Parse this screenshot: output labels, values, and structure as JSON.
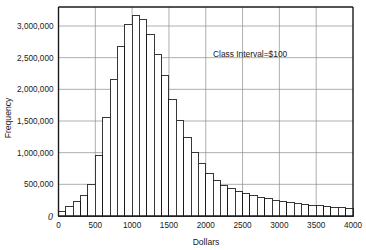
{
  "chart_data": {
    "type": "bar",
    "title": "",
    "xlabel": "Dollars",
    "ylabel": "Frequency",
    "annotation": "Class Interval=$100",
    "xlim": [
      0,
      4000
    ],
    "ylim": [
      0,
      3300000
    ],
    "grid": true,
    "legend": "none",
    "xticks": [
      0,
      500,
      1000,
      1500,
      2000,
      2500,
      3000,
      3500,
      4000
    ],
    "xtick_labels": [
      "0",
      "500",
      "1000",
      "1500",
      "2000",
      "2500",
      "3000",
      "3500",
      "4000"
    ],
    "yticks": [
      0,
      500000,
      1000000,
      1500000,
      2000000,
      2500000,
      3000000
    ],
    "ytick_labels": [
      "0",
      "500,000",
      "1,000,000",
      "1,500,000",
      "2,000,000",
      "2,500,000",
      "3,000,000"
    ],
    "bars": [
      {
        "x0": 0,
        "x1": 100,
        "value": 70000
      },
      {
        "x0": 100,
        "x1": 200,
        "value": 150000
      },
      {
        "x0": 200,
        "x1": 300,
        "value": 225000
      },
      {
        "x0": 300,
        "x1": 400,
        "value": 330000
      },
      {
        "x0": 400,
        "x1": 500,
        "value": 505000
      },
      {
        "x0": 500,
        "x1": 600,
        "value": 955000
      },
      {
        "x0": 600,
        "x1": 700,
        "value": 1550000
      },
      {
        "x0": 700,
        "x1": 800,
        "value": 2150000
      },
      {
        "x0": 800,
        "x1": 900,
        "value": 2670000
      },
      {
        "x0": 900,
        "x1": 1000,
        "value": 3020000
      },
      {
        "x0": 1000,
        "x1": 1100,
        "value": 3160000
      },
      {
        "x0": 1100,
        "x1": 1200,
        "value": 3105000
      },
      {
        "x0": 1200,
        "x1": 1300,
        "value": 2870000
      },
      {
        "x0": 1300,
        "x1": 1400,
        "value": 2555000
      },
      {
        "x0": 1400,
        "x1": 1500,
        "value": 2215000
      },
      {
        "x0": 1500,
        "x1": 1600,
        "value": 1835000
      },
      {
        "x0": 1600,
        "x1": 1700,
        "value": 1515000
      },
      {
        "x0": 1700,
        "x1": 1800,
        "value": 1240000
      },
      {
        "x0": 1800,
        "x1": 1900,
        "value": 1010000
      },
      {
        "x0": 1900,
        "x1": 2000,
        "value": 830000
      },
      {
        "x0": 2000,
        "x1": 2100,
        "value": 675000
      },
      {
        "x0": 2100,
        "x1": 2200,
        "value": 555000
      },
      {
        "x0": 2200,
        "x1": 2300,
        "value": 480000
      },
      {
        "x0": 2300,
        "x1": 2400,
        "value": 430000
      },
      {
        "x0": 2400,
        "x1": 2500,
        "value": 385000
      },
      {
        "x0": 2500,
        "x1": 2600,
        "value": 350000
      },
      {
        "x0": 2600,
        "x1": 2700,
        "value": 320000
      },
      {
        "x0": 2700,
        "x1": 2800,
        "value": 295000
      },
      {
        "x0": 2800,
        "x1": 2900,
        "value": 270000
      },
      {
        "x0": 2900,
        "x1": 3000,
        "value": 250000
      },
      {
        "x0": 3000,
        "x1": 3100,
        "value": 230000
      },
      {
        "x0": 3100,
        "x1": 3200,
        "value": 215000
      },
      {
        "x0": 3200,
        "x1": 3300,
        "value": 200000
      },
      {
        "x0": 3300,
        "x1": 3400,
        "value": 185000
      },
      {
        "x0": 3400,
        "x1": 3500,
        "value": 172000
      },
      {
        "x0": 3500,
        "x1": 3600,
        "value": 160000
      },
      {
        "x0": 3600,
        "x1": 3700,
        "value": 150000
      },
      {
        "x0": 3700,
        "x1": 3800,
        "value": 140000
      },
      {
        "x0": 3800,
        "x1": 3900,
        "value": 130000
      },
      {
        "x0": 3900,
        "x1": 4000,
        "value": 120000
      }
    ]
  },
  "labels": {
    "zero_origin": "0"
  }
}
